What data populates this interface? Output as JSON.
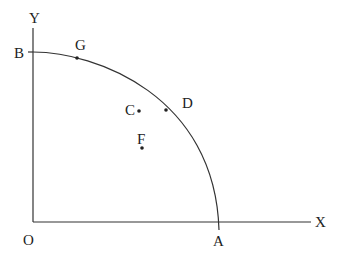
{
  "diagram": {
    "axes": {
      "x_label": "X",
      "y_label": "Y",
      "origin_label": "O"
    },
    "curve": {
      "start_label": "B",
      "end_label": "A",
      "description": "concave curve from B on Y-axis to A on X-axis"
    },
    "points": [
      {
        "label": "G",
        "on_curve": true
      },
      {
        "label": "D",
        "on_curve": true
      },
      {
        "label": "C",
        "on_curve": false
      },
      {
        "label": "F",
        "on_curve": false
      }
    ],
    "colors": {
      "line": "#333333",
      "text": "#222222"
    }
  }
}
